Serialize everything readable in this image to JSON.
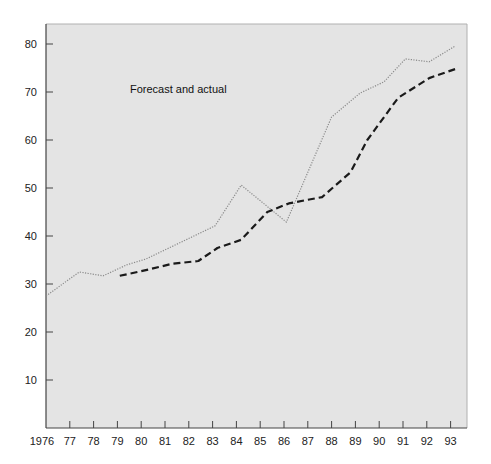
{
  "chart_data": {
    "type": "line",
    "title": "",
    "annotation": "Forecast and actual",
    "xlabel": "",
    "ylabel": "",
    "x_tick_labels": [
      "1976",
      "77",
      "78",
      "79",
      "80",
      "81",
      "82",
      "83",
      "84",
      "85",
      "86",
      "87",
      "88",
      "89",
      "90",
      "91",
      "92",
      "93"
    ],
    "y_ticks": [
      10,
      20,
      30,
      40,
      50,
      60,
      70,
      80
    ],
    "xlim": [
      1976,
      1993.6
    ],
    "ylim": [
      0,
      84
    ],
    "grid": false,
    "legend": "none",
    "series": [
      {
        "name": "Forecast",
        "style": "dotted",
        "color": "#8a8a8a",
        "points": [
          [
            1976.0,
            27.5
          ],
          [
            1977.4,
            32.5
          ],
          [
            1978.4,
            31.7
          ],
          [
            1979.4,
            34.0
          ],
          [
            1980.2,
            35.2
          ],
          [
            1983.1,
            42.1
          ],
          [
            1984.2,
            50.6
          ],
          [
            1986.1,
            42.9
          ],
          [
            1988.0,
            64.8
          ],
          [
            1989.2,
            69.8
          ],
          [
            1990.2,
            72.1
          ],
          [
            1991.1,
            76.9
          ],
          [
            1992.1,
            76.3
          ],
          [
            1993.2,
            79.6
          ]
        ]
      },
      {
        "name": "Actual",
        "style": "dashed",
        "color": "#1a1a1a",
        "points": [
          [
            1979.1,
            31.7
          ],
          [
            1980.3,
            33.0
          ],
          [
            1981.3,
            34.2
          ],
          [
            1982.4,
            34.8
          ],
          [
            1983.2,
            37.5
          ],
          [
            1984.2,
            39.2
          ],
          [
            1985.3,
            45.0
          ],
          [
            1986.2,
            46.8
          ],
          [
            1987.6,
            48.1
          ],
          [
            1988.8,
            53.3
          ],
          [
            1989.5,
            60.0
          ],
          [
            1990.8,
            68.8
          ],
          [
            1992.1,
            72.9
          ],
          [
            1993.2,
            74.8
          ]
        ]
      }
    ]
  },
  "colors": {
    "plot_background": "#e4e4e4",
    "axis": "#444444",
    "frame": "#b0b0b0"
  }
}
